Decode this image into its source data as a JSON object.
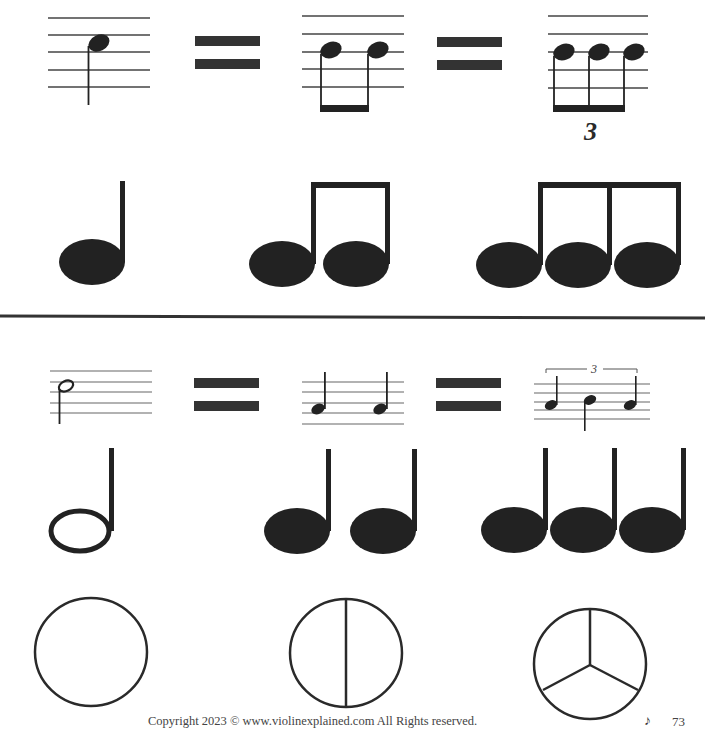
{
  "page": {
    "footer": {
      "copyright": "Copyright 2023 © www.violinexplained.com All Rights reserved.",
      "page_icon": "eighth-note-icon",
      "page_icon_glyph": "♪",
      "page_number": "73"
    }
  },
  "section_top": {
    "description": "One quarter note equals two eighth notes equals three eighth-note triplets",
    "staff_examples": [
      {
        "label": "quarter-note",
        "notes": 1
      },
      {
        "label": "two-eighth-notes",
        "notes": 2
      },
      {
        "label": "eighth-note-triplet",
        "notes": 3,
        "tuplet_label": "3"
      }
    ],
    "equals_signs": 2,
    "large_notes": [
      {
        "label": "quarter-note",
        "count": 1
      },
      {
        "label": "two-beamed-eighths",
        "count": 2
      },
      {
        "label": "three-beamed-eighths",
        "count": 3
      }
    ]
  },
  "section_bottom": {
    "description": "One half note equals two quarter notes equals three quarter-note triplets",
    "staff_examples": [
      {
        "label": "half-note",
        "notes": 1
      },
      {
        "label": "two-quarter-notes",
        "notes": 2
      },
      {
        "label": "quarter-note-triplet",
        "notes": 3,
        "tuplet_label": "3"
      }
    ],
    "equals_signs": 2,
    "large_notes": [
      {
        "label": "half-note",
        "count": 1
      },
      {
        "label": "two-quarter-notes",
        "count": 2
      },
      {
        "label": "three-quarter-notes",
        "count": 3
      }
    ],
    "pie_circles": [
      {
        "label": "whole",
        "divisions": 1
      },
      {
        "label": "halves",
        "divisions": 2
      },
      {
        "label": "thirds",
        "divisions": 3
      }
    ]
  },
  "colors": {
    "ink": "#2a2a2a",
    "staff": "#555555",
    "background": "#ffffff"
  }
}
